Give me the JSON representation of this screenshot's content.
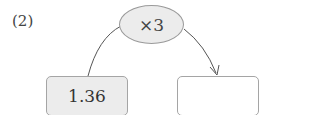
{
  "problem": {
    "label": "(2)",
    "operator": "×3",
    "input_value": "1.36",
    "output_value": ""
  },
  "colors": {
    "shape_fill": "#ececec",
    "border": "#a5a5a5",
    "line": "#555555"
  }
}
